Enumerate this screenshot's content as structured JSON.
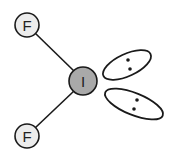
{
  "diagram": {
    "central_atom": {
      "label": "I",
      "cx": 83,
      "cy": 81,
      "r": 14,
      "fill": "#a9a9a9"
    },
    "outer_atoms": [
      {
        "label": "F",
        "cx": 27,
        "cy": 25,
        "r": 12,
        "fill": "#ececec"
      },
      {
        "label": "F",
        "cx": 27,
        "cy": 136,
        "r": 12,
        "fill": "#ececec"
      }
    ],
    "bonds": [
      {
        "from": "I",
        "to": "F-top"
      },
      {
        "from": "I",
        "to": "F-bottom"
      }
    ],
    "lone_pairs": [
      {
        "cx": 127,
        "cy": 65,
        "rx": 26,
        "ry": 11,
        "angle": -25,
        "dots": [
          [
            128,
            60
          ],
          [
            130,
            69
          ]
        ]
      },
      {
        "cx": 134,
        "cy": 104,
        "rx": 31,
        "ry": 11,
        "angle": 22,
        "dots": [
          [
            137,
            100
          ],
          [
            134,
            109
          ]
        ]
      }
    ],
    "stroke_color": "#1a1a1a"
  }
}
